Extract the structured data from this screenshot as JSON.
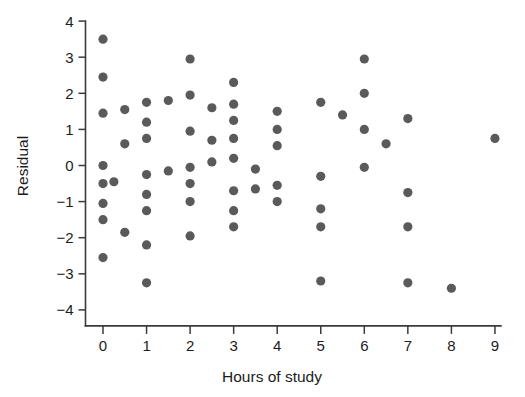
{
  "figure": {
    "background_color": "#ffffff",
    "axis_color": "#3b3b3b",
    "point_color": "#5a5a5a",
    "point_radius": 4.6
  },
  "axes": {
    "x_title": "Hours of study",
    "y_title": "Residual",
    "x_ticks": [
      "0",
      "1",
      "2",
      "3",
      "4",
      "5",
      "6",
      "7",
      "8",
      "9"
    ],
    "y_ticks": [
      "4",
      "3",
      "2",
      "1",
      "0",
      "−1",
      "−2",
      "−3",
      "−4"
    ]
  },
  "chart_data": {
    "type": "scatter",
    "title": "",
    "xlabel": "Hours of study",
    "ylabel": "Residual",
    "xlim": [
      -0.45,
      9.55
    ],
    "ylim": [
      -4.45,
      4.15
    ],
    "xticks": [
      0,
      1,
      2,
      3,
      4,
      5,
      6,
      7,
      8,
      9
    ],
    "yticks": [
      4,
      3,
      2,
      1,
      0,
      -1,
      -2,
      -3,
      -4
    ],
    "grid": false,
    "legend": "none",
    "series": [
      {
        "name": "Residuals",
        "color": "#5a5a5a",
        "points": [
          [
            0.0,
            3.5
          ],
          [
            0.0,
            2.45
          ],
          [
            0.0,
            1.45
          ],
          [
            0.0,
            0.0
          ],
          [
            0.0,
            -0.5
          ],
          [
            0.25,
            -0.45
          ],
          [
            0.0,
            -1.05
          ],
          [
            0.0,
            -1.5
          ],
          [
            0.0,
            -2.55
          ],
          [
            0.5,
            1.55
          ],
          [
            0.5,
            0.6
          ],
          [
            0.5,
            -1.85
          ],
          [
            1.0,
            1.75
          ],
          [
            1.0,
            1.2
          ],
          [
            1.0,
            0.75
          ],
          [
            1.0,
            -0.25
          ],
          [
            1.0,
            -0.8
          ],
          [
            1.0,
            -1.25
          ],
          [
            1.0,
            -2.2
          ],
          [
            1.0,
            -3.25
          ],
          [
            1.5,
            1.8
          ],
          [
            1.5,
            -0.15
          ],
          [
            2.0,
            2.95
          ],
          [
            2.0,
            1.95
          ],
          [
            2.0,
            0.95
          ],
          [
            2.0,
            -0.05
          ],
          [
            2.0,
            -0.5
          ],
          [
            2.0,
            -1.0
          ],
          [
            2.0,
            -1.95
          ],
          [
            2.5,
            1.6
          ],
          [
            2.5,
            0.7
          ],
          [
            2.5,
            0.1
          ],
          [
            3.0,
            2.3
          ],
          [
            3.0,
            1.7
          ],
          [
            3.0,
            1.25
          ],
          [
            3.0,
            0.75
          ],
          [
            3.0,
            0.2
          ],
          [
            3.0,
            -0.7
          ],
          [
            3.0,
            -1.25
          ],
          [
            3.0,
            -1.7
          ],
          [
            3.5,
            -0.1
          ],
          [
            3.5,
            -0.65
          ],
          [
            4.0,
            1.5
          ],
          [
            4.0,
            1.0
          ],
          [
            4.0,
            0.55
          ],
          [
            4.0,
            -0.55
          ],
          [
            4.0,
            -1.0
          ],
          [
            5.0,
            1.75
          ],
          [
            5.0,
            -0.3
          ],
          [
            5.0,
            -1.2
          ],
          [
            5.0,
            -1.7
          ],
          [
            5.0,
            -3.2
          ],
          [
            5.5,
            1.4
          ],
          [
            6.0,
            2.95
          ],
          [
            6.0,
            2.0
          ],
          [
            6.0,
            1.0
          ],
          [
            6.0,
            -0.05
          ],
          [
            6.5,
            0.6
          ],
          [
            7.0,
            1.3
          ],
          [
            7.0,
            -0.75
          ],
          [
            7.0,
            -1.7
          ],
          [
            7.0,
            -3.25
          ],
          [
            8.0,
            -3.4
          ],
          [
            9.0,
            0.75
          ]
        ]
      }
    ]
  }
}
